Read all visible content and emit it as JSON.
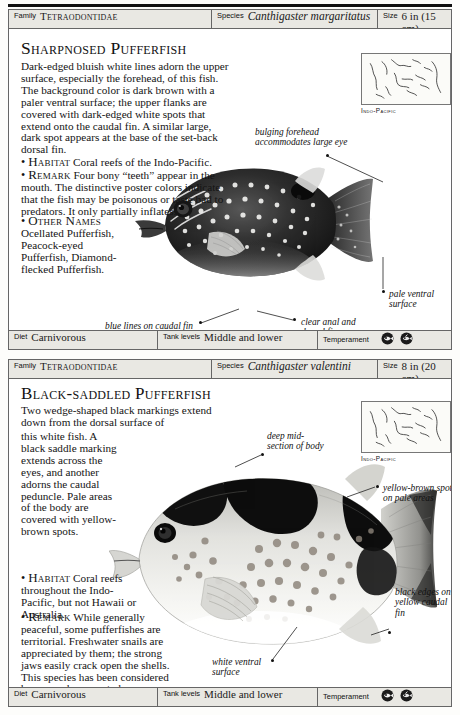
{
  "document": {
    "type": "field-guide-page",
    "entries": [
      {
        "id": "sharpnosed-pufferfish",
        "header": {
          "family_label": "Family",
          "family_value": "Tetraodontidae",
          "species_label": "Species",
          "species_value": "Canthigaster margaritatus",
          "size_label": "Size",
          "size_value": "6 in (15 cm)"
        },
        "title": "Sharpnosed Pufferfish",
        "paragraphs": [
          "Dark-edged bluish white lines adorn the upper surface, especially the forehead, of this fish. The background color is dark brown with a paler ventral surface; the upper flanks are covered with dark-edged white spots that extend onto the caudal fin. A similar large, dark spot appears at the base of the set-back dorsal fin."
        ],
        "habitat_label": "Habitat",
        "habitat_text": "Coral reefs of the Indo-Pacific.",
        "remark_label": "Remark",
        "remark_text": "Four bony “teeth” appear in the mouth. The distinctive poster colors indicate that the fish may be poisonous or taste bad to predators. It only partially inflates.",
        "other_names_label": "Other Names",
        "other_names_text": "Ocellated Pufferfish, Peacock-eyed Pufferfish, Diamond-flecked Pufferfish.",
        "map_caption": "Indo-Pacific",
        "callouts": [
          {
            "name": "bulging-forehead",
            "text": "bulging forehead accommodates large eye"
          },
          {
            "name": "blue-lines-caudal-fin",
            "text": "blue lines on caudal fin"
          },
          {
            "name": "clear-anal-dorsal-fins",
            "text": "clear anal and dorsal fins"
          },
          {
            "name": "pale-ventral-surface",
            "text": "pale ventral surface"
          }
        ],
        "footer": {
          "diet_label": "Diet",
          "diet_value": "Carnivorous",
          "tank_label": "Tank levels",
          "tank_value": "Middle and lower",
          "temperament_label": "Temperament",
          "temperament_icons": [
            "aggressive-fish-icon",
            "territorial-fish-icon"
          ]
        }
      },
      {
        "id": "black-saddled-pufferfish",
        "header": {
          "family_label": "Family",
          "family_value": "Tetraodontidae",
          "species_label": "Species",
          "species_value": "Canthigaster valentini",
          "size_label": "Size",
          "size_value": "8 in (20 cm)"
        },
        "title": "Black-saddled Pufferfish",
        "paragraphs": [
          "Two wedge-shaped black markings extend down from the dorsal surface of this white fish. A black saddle marking extends across the eyes, and another adorns the caudal peduncle. Pale areas of the body are covered with yellow-brown spots."
        ],
        "habitat_label": "Habitat",
        "habitat_text": "Coral reefs throughout the Indo-Pacific, but not Hawaii or Australia.",
        "remark_label": "Remark",
        "remark_text_pre": "While generally peaceful, some pufferfishes are territorial. Freshwater snails are appreciated by them; the strong jaws easily crack open the shells. This species has been considered by some observers to be synonymous with ",
        "remark_text_italic": "Canthigaster cinctus",
        "remark_text_post": ".",
        "map_caption": "Indo-Pacific",
        "callouts": [
          {
            "name": "deep-midsection",
            "text": "deep mid-section of body"
          },
          {
            "name": "yellow-brown-spots",
            "text": "yellow-brown spots on pale areas"
          },
          {
            "name": "black-edges-caudal-fin",
            "text": "black edges on yellow caudal fin"
          },
          {
            "name": "white-ventral-surface",
            "text": "white ventral surface"
          }
        ],
        "footer": {
          "diet_label": "Diet",
          "diet_value": "Carnivorous",
          "tank_label": "Tank levels",
          "tank_value": "Middle and lower",
          "temperament_label": "Temperament",
          "temperament_icons": [
            "aggressive-fish-icon",
            "territorial-fish-icon"
          ]
        }
      }
    ],
    "colors": {
      "page_background": "#fdfdfb",
      "strip_background": "#e9e8e3",
      "rule": "#666666",
      "text": "#141414"
    }
  }
}
